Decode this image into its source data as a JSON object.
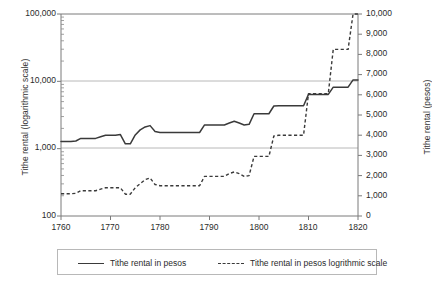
{
  "chart_data": {
    "type": "line",
    "title": "",
    "xlabel": "",
    "ylabel": "Tithe rental (logarithmic scale)",
    "y2label": "Tithe rental (pesos)",
    "xlim": [
      1760,
      1820
    ],
    "xticks": [
      "1760",
      "1770",
      "1780",
      "1790",
      "1800",
      "1810",
      "1820"
    ],
    "xtick_values": [
      1760,
      1770,
      1780,
      1790,
      1800,
      1810,
      1820
    ],
    "yscale": "log",
    "ylim": [
      100,
      100000
    ],
    "yticks": [
      "100",
      "1,000",
      "10,000",
      "100,000"
    ],
    "ytick_values": [
      100,
      1000,
      10000,
      100000
    ],
    "y2lim": [
      0,
      10000
    ],
    "y2ticks": [
      "0",
      "1,000",
      "2,000",
      "3,000",
      "4,000",
      "5,000",
      "6,000",
      "7,000",
      "8,000",
      "9,000",
      "10,000"
    ],
    "y2tick_values": [
      0,
      1000,
      2000,
      3000,
      4000,
      5000,
      6000,
      7000,
      8000,
      9000,
      10000
    ],
    "grid": "horizontal gridlines at 1,000 and 10,000",
    "legend_position": "below",
    "x": [
      1760,
      1761,
      1762,
      1763,
      1764,
      1765,
      1766,
      1767,
      1768,
      1769,
      1770,
      1771,
      1772,
      1773,
      1774,
      1775,
      1776,
      1777,
      1778,
      1779,
      1780,
      1781,
      1782,
      1783,
      1784,
      1785,
      1786,
      1787,
      1788,
      1789,
      1790,
      1791,
      1792,
      1793,
      1794,
      1795,
      1796,
      1797,
      1798,
      1799,
      1800,
      1801,
      1802,
      1803,
      1804,
      1805,
      1806,
      1807,
      1808,
      1809,
      1810,
      1811,
      1812,
      1813,
      1814,
      1815,
      1816,
      1817,
      1818,
      1819,
      1820
    ],
    "series": [
      {
        "name": "Tithe rental in pesos",
        "style": "solid",
        "color": "#3a3a3a",
        "axis": "right",
        "values": [
          1100,
          1100,
          1100,
          1120,
          1250,
          1250,
          1250,
          1250,
          1330,
          1400,
          1400,
          1400,
          1400,
          1080,
          1080,
          1400,
          1600,
          1800,
          1880,
          1560,
          1500,
          1500,
          1500,
          1500,
          1500,
          1500,
          1500,
          1500,
          1500,
          1960,
          1960,
          1960,
          1960,
          1960,
          2100,
          2180,
          2100,
          1960,
          2000,
          2950,
          2950,
          2950,
          2950,
          3960,
          4000,
          4000,
          4000,
          4000,
          4000,
          4000,
          6060,
          6060,
          6060,
          6060,
          6060,
          8250,
          8250,
          8250,
          8250,
          10000,
          10000
        ]
      },
      {
        "name": "Tithe rental in pesos logrithmic scale",
        "style": "dashed",
        "color": "#3a3a3a",
        "axis": "right",
        "values": [
          1100,
          1100,
          1100,
          1120,
          1250,
          1250,
          1250,
          1250,
          1330,
          1400,
          1400,
          1400,
          1400,
          1080,
          1080,
          1400,
          1600,
          1800,
          1880,
          1560,
          1500,
          1500,
          1500,
          1500,
          1500,
          1500,
          1500,
          1500,
          1500,
          1960,
          1960,
          1960,
          1960,
          1960,
          2100,
          2180,
          2100,
          1960,
          2000,
          2950,
          2950,
          2950,
          2950,
          3960,
          4000,
          4000,
          4000,
          4000,
          4000,
          4000,
          6060,
          6060,
          6060,
          6060,
          6060,
          8250,
          8250,
          8250,
          8250,
          10000,
          10000
        ]
      }
    ],
    "plotted_log_series": {
      "name": "Tithe rental in pesos (plotted on log axis)",
      "values": [
        1280,
        1280,
        1280,
        1300,
        1420,
        1420,
        1420,
        1420,
        1500,
        1580,
        1580,
        1580,
        1620,
        1180,
        1180,
        1600,
        1900,
        2100,
        2200,
        1800,
        1740,
        1740,
        1740,
        1740,
        1740,
        1740,
        1740,
        1740,
        1740,
        2250,
        2250,
        2250,
        2250,
        2250,
        2400,
        2550,
        2400,
        2250,
        2300,
        3300,
        3300,
        3300,
        3300,
        4300,
        4350,
        4350,
        4350,
        4350,
        4350,
        4350,
        6400,
        6400,
        6400,
        6400,
        6400,
        8200,
        8200,
        8200,
        8200,
        10500,
        10500
      ]
    }
  },
  "legend": {
    "entries": [
      {
        "label": "Tithe rental in pesos",
        "style": "solid"
      },
      {
        "label": "Tithe rental in pesos logrithmic scale",
        "style": "dashed"
      }
    ]
  }
}
